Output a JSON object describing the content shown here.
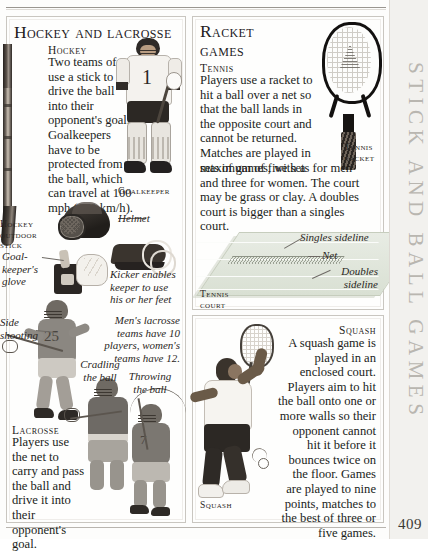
{
  "page": {
    "folio": "409",
    "side_tab_label": "STICK AND BALL GAMES"
  },
  "panels": {
    "hockey": {
      "heading": "Hockey and lacrosse",
      "sections": [
        {
          "subhead": "Hockey",
          "body": "Two teams of 11 use a stick to drive the ball into their opponent's goal. Goalkeepers have to be protected from the ball, which can travel at 100 mph (160 km/h)."
        },
        {
          "subhead": "Lacrosse",
          "body": "Players use the net to carry and pass the ball and drive it into their opponent's goal."
        }
      ],
      "captions": [
        {
          "name": "goalkeeper",
          "text": "Goalkeeper",
          "style": "smallcaps"
        },
        {
          "name": "hockey-outdoor-stick",
          "text": "Hockey outdoor stick",
          "style": "smallcaps"
        },
        {
          "name": "helmet",
          "text": "Helmet",
          "style": "italic"
        },
        {
          "name": "goalkeepers-glove",
          "text": "Goal-keeper's glove",
          "style": "italic"
        },
        {
          "name": "kicker",
          "text": "Kicker enables keeper to use his or her feet",
          "style": "italic"
        },
        {
          "name": "side-shooting",
          "text": "Side shooting",
          "style": "italic"
        },
        {
          "name": "lacrosse-teams-note",
          "text": "Men's lacrosse teams have 10 players, women's teams have 12.",
          "style": "italic"
        },
        {
          "name": "cradling-the-ball",
          "text": "Cradling the ball",
          "style": "italic"
        },
        {
          "name": "throwing-the-ball",
          "text": "Throwing the ball",
          "style": "italic"
        }
      ]
    },
    "racket": {
      "heading": "Racket games",
      "sections": [
        {
          "subhead": "Tennis",
          "body_narrow": "Players use a racket to hit a ball over a net so that the ball lands in the opposite court and cannot be returned. Matches are played in sets of games, with a",
          "body_wide": "maximum of five sets for men and three for women. The court may be grass or clay. A doubles court is bigger than a singles court."
        }
      ],
      "captions": [
        {
          "name": "tennis-racket",
          "text": "Tennis racket",
          "style": "smallcaps"
        },
        {
          "name": "singles-sideline",
          "text": "Singles sideline",
          "style": "italic"
        },
        {
          "name": "net",
          "text": "Net",
          "style": "italic"
        },
        {
          "name": "doubles-sideline",
          "text": "Doubles sideline",
          "style": "italic"
        },
        {
          "name": "tennis-court",
          "text": "Tennis court",
          "style": "smallcaps"
        }
      ]
    },
    "squash": {
      "sections": [
        {
          "subhead": "Squash",
          "body": "A squash game is played in an enclosed court. Players aim to hit the ball onto one or more walls so their opponent cannot hit it before it bounces twice on the floor. Games are played to nine points, matches to the best of three or five games."
        }
      ],
      "captions": [
        {
          "name": "squash",
          "text": "Squash",
          "style": "smallcaps"
        }
      ]
    }
  }
}
